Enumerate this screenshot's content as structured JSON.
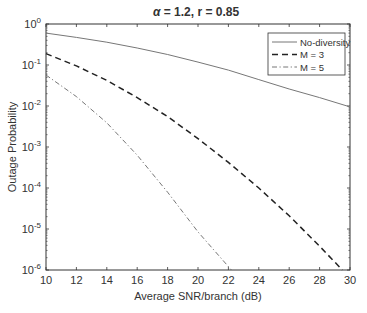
{
  "chart_data": {
    "type": "line",
    "title": "α = 1.2,  r = 0.85",
    "title_parts": {
      "alpha_symbol": "α",
      "alpha_text": " = 1.2,  r = 0.85"
    },
    "xlabel": "Average SNR/branch (dB)",
    "ylabel": "Outage Probability",
    "xlim": [
      10,
      30
    ],
    "ylim": [
      1e-06,
      1
    ],
    "yscale": "log",
    "xticks": [
      10,
      12,
      14,
      16,
      18,
      20,
      22,
      24,
      26,
      28,
      30
    ],
    "xtick_labels": [
      "10",
      "12",
      "14",
      "16",
      "18",
      "20",
      "22",
      "24",
      "26",
      "28",
      "30"
    ],
    "yticks_exponents": [
      0,
      -1,
      -2,
      -3,
      -4,
      -5,
      -6
    ],
    "ytick_base": "10",
    "grid": false,
    "legend_position": "top-right",
    "series": [
      {
        "name": "No-diversity",
        "style": "solid",
        "x": [
          10,
          12,
          14,
          16,
          18,
          20,
          22,
          24,
          26,
          28,
          30
        ],
        "y": [
          0.6,
          0.47,
          0.36,
          0.26,
          0.18,
          0.118,
          0.075,
          0.044,
          0.026,
          0.016,
          0.0095
        ]
      },
      {
        "name": "M = 3",
        "style": "dashed",
        "x": [
          10,
          12,
          14,
          16,
          18,
          20,
          22,
          24,
          26,
          28,
          29.5
        ],
        "y": [
          0.19,
          0.095,
          0.042,
          0.016,
          0.0055,
          0.0016,
          0.00042,
          0.0001,
          2.1e-05,
          3.8e-06,
          1e-06
        ]
      },
      {
        "name": "M = 5",
        "style": "dashdot",
        "x": [
          10,
          12,
          14,
          16,
          18,
          20,
          22.2
        ],
        "y": [
          0.057,
          0.017,
          0.0039,
          0.00063,
          7.9e-05,
          8.5e-06,
          1e-06
        ]
      }
    ]
  }
}
